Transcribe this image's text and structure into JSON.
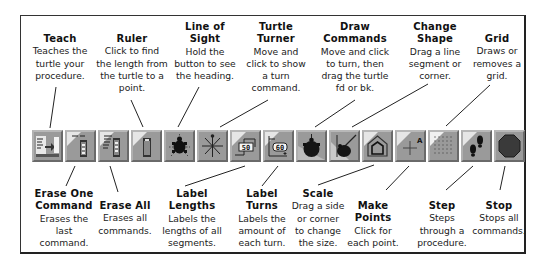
{
  "top_labels": [
    {
      "title": "Teach",
      "desc": [
        "Teaches the",
        "turtle your",
        "procedure."
      ]
    },
    {
      "title": "Ruler",
      "desc": [
        "Click to find",
        "the length from",
        "the turtle to a",
        "point."
      ]
    },
    {
      "title": [
        "Line of",
        "Sight"
      ],
      "desc": [
        "Hold the",
        "button to see",
        "the heading."
      ]
    },
    {
      "title": [
        "Turtle",
        "Turner"
      ],
      "desc": [
        "Move and",
        "click to show",
        "a turn",
        "command."
      ]
    },
    {
      "title": [
        "Draw",
        "Commands"
      ],
      "desc": [
        "Move and click",
        "to turn, then",
        "drag the turtle",
        "fd or bk."
      ]
    },
    {
      "title": [
        "Change",
        "Shape"
      ],
      "desc": [
        "Drag a line",
        "segment or",
        "corner."
      ]
    },
    {
      "title": "Grid",
      "desc": [
        "Draws or",
        "removes a",
        "grid."
      ]
    }
  ],
  "bottom_labels": [
    {
      "title": [
        "Erase One",
        "Command"
      ],
      "desc": [
        "Erases the",
        "last",
        "command."
      ]
    },
    {
      "title": "Erase All",
      "desc": [
        "Erases all",
        "commands."
      ]
    },
    {
      "title": [
        "Label",
        "Lengths"
      ],
      "desc": [
        "Labels the",
        "lengths of all",
        "segments."
      ]
    },
    {
      "title": [
        "Label",
        "Turns"
      ],
      "desc": [
        "Labels the",
        "amount of",
        "each turn."
      ]
    },
    {
      "title": "Scale",
      "desc": [
        "Drag a side",
        "or corner",
        "to change",
        "the size."
      ]
    },
    {
      "title": [
        "Make",
        "Points"
      ],
      "desc": [
        "Click for",
        "each point."
      ]
    },
    {
      "title": "Step",
      "desc": [
        "Steps",
        "through a",
        "procedure."
      ]
    },
    {
      "title": "Stop",
      "desc": [
        "Stops all",
        "commands."
      ]
    }
  ],
  "toolbar": {
    "buttons": [
      {
        "name": "teach",
        "icon": "teach-icon"
      },
      {
        "name": "erase-one-command",
        "icon": "erase-one-icon"
      },
      {
        "name": "erase-all",
        "icon": "erase-all-icon"
      },
      {
        "name": "ruler",
        "icon": "ruler-icon"
      },
      {
        "name": "line-of-sight",
        "icon": "turtle-icon"
      },
      {
        "name": "turtle-turner",
        "icon": "turner-star-icon"
      },
      {
        "name": "label-lengths",
        "icon": "label-lengths-icon",
        "text": "50"
      },
      {
        "name": "label-turns",
        "icon": "label-turns-icon",
        "text": "60"
      },
      {
        "name": "draw-commands",
        "icon": "draw-turtle-icon"
      },
      {
        "name": "scale",
        "icon": "scale-icon"
      },
      {
        "name": "change-shape",
        "icon": "house-shape-icon"
      },
      {
        "name": "make-points",
        "icon": "make-points-icon",
        "text": "A"
      },
      {
        "name": "grid",
        "icon": "grid-icon"
      },
      {
        "name": "step",
        "icon": "footsteps-icon"
      },
      {
        "name": "stop",
        "icon": "stop-sign-icon"
      }
    ]
  },
  "colors": {
    "button_face": "#9a9a9a",
    "button_highlight": "#e6e6e6",
    "button_shadow": "#6a6a6a",
    "ink": "#111111"
  }
}
